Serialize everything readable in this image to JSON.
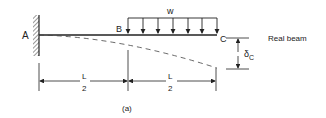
{
  "diagram": {
    "caption": "(a)",
    "title": "Real beam",
    "points": {
      "a": "A",
      "b": "B",
      "c": "C"
    },
    "load_label": "w",
    "deflection_symbol": "δ",
    "deflection_subscript": "C",
    "dimensions": [
      {
        "num": "L",
        "den": "2"
      },
      {
        "num": "L",
        "den": "2"
      }
    ]
  }
}
